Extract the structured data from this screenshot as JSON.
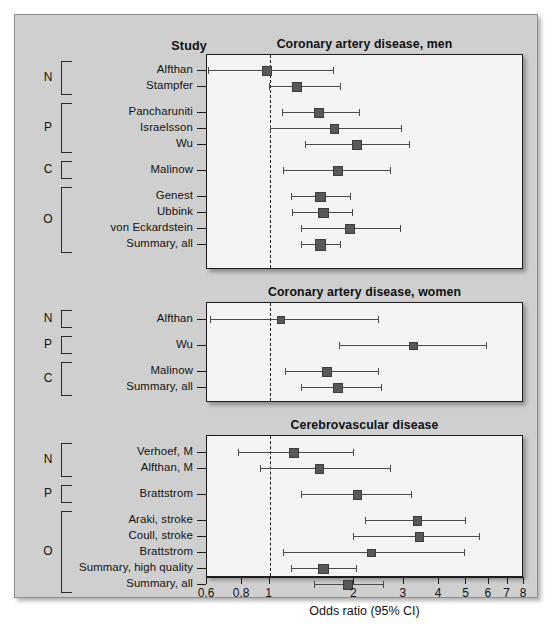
{
  "figure": {
    "axis_title": "Odds ratio (95% CI)",
    "study_column_header": "Study",
    "group_letters": [
      "N",
      "P",
      "C",
      "O"
    ],
    "tick_labels": [
      "0.6",
      "0.8",
      "1",
      "2",
      "3",
      "4",
      "5",
      "6",
      "7",
      "8"
    ],
    "colors": {
      "background": "#cfcfcf",
      "plot_background": "#f4f4f4",
      "marker": "#585858",
      "line": "#4a4a4a",
      "frame": "#1c1c1c"
    }
  },
  "chart_data": {
    "type": "scatter",
    "xlabel": "Odds ratio (95% CI)",
    "ylabel": "Study",
    "xscale": "log",
    "xlim": [
      0.6,
      8
    ],
    "xticks": [
      0.6,
      0.8,
      1,
      2,
      3,
      4,
      5,
      6,
      7,
      8
    ],
    "xticklabels": [
      "0.6",
      "0.8",
      "1",
      "2",
      "3",
      "4",
      "5",
      "6",
      "7",
      "8"
    ],
    "reference_line": 1,
    "grid": false,
    "legend": "none",
    "panels": [
      {
        "title": "Coronary artery disease, men",
        "groups": [
          {
            "letter": "N",
            "rows": [
              {
                "label": "Alfthan",
                "or": 0.98,
                "lo": 0.61,
                "hi": 1.7
              },
              {
                "label": "Stampfer",
                "or": 1.25,
                "lo": 1.0,
                "hi": 1.8
              }
            ]
          },
          {
            "letter": "P",
            "rows": [
              {
                "label": "Pancharuniti",
                "or": 1.5,
                "lo": 1.12,
                "hi": 2.1
              },
              {
                "label": "Israelsson",
                "or": 1.7,
                "lo": 1.01,
                "hi": 2.95
              },
              {
                "label": "Wu",
                "or": 2.05,
                "lo": 1.35,
                "hi": 3.15
              }
            ]
          },
          {
            "letter": "C",
            "rows": [
              {
                "label": "Malinow",
                "or": 1.75,
                "lo": 1.13,
                "hi": 2.7
              }
            ]
          },
          {
            "letter": "O",
            "rows": [
              {
                "label": "Genest",
                "or": 1.52,
                "lo": 1.2,
                "hi": 1.95
              },
              {
                "label": "Ubbink",
                "or": 1.55,
                "lo": 1.21,
                "hi": 1.98
              },
              {
                "label": "von Eckardstein",
                "or": 1.93,
                "lo": 1.3,
                "hi": 2.92
              },
              {
                "label": "Summary, all",
                "or": 1.52,
                "lo": 1.3,
                "hi": 1.8
              }
            ]
          }
        ]
      },
      {
        "title": "Coronary artery disease, women",
        "groups": [
          {
            "letter": "N",
            "rows": [
              {
                "label": "Alfthan",
                "or": 1.1,
                "lo": 0.62,
                "hi": 2.45
              }
            ]
          },
          {
            "letter": "P",
            "rows": [
              {
                "label": "Wu",
                "or": 3.25,
                "lo": 1.78,
                "hi": 5.9
              }
            ]
          },
          {
            "letter": "C",
            "rows": [
              {
                "label": "Malinow",
                "or": 1.6,
                "lo": 1.14,
                "hi": 2.45
              },
              {
                "label": "Summary, all",
                "or": 1.75,
                "lo": 1.3,
                "hi": 2.5
              }
            ]
          }
        ]
      },
      {
        "title": "Cerebrovascular disease",
        "groups": [
          {
            "letter": "N",
            "rows": [
              {
                "label": "Verhoef, M",
                "or": 1.22,
                "lo": 0.78,
                "hi": 2.0
              },
              {
                "label": "Alfthan, M",
                "or": 1.5,
                "lo": 0.93,
                "hi": 2.7
              }
            ]
          },
          {
            "letter": "P",
            "rows": [
              {
                "label": "Brattstrom",
                "or": 2.05,
                "lo": 1.3,
                "hi": 3.2
              }
            ]
          },
          {
            "letter": "O",
            "rows": [
              {
                "label": "Araki, stroke",
                "or": 3.35,
                "lo": 2.2,
                "hi": 5.0
              },
              {
                "label": "Coull, stroke",
                "or": 3.4,
                "lo": 2.0,
                "hi": 5.6
              },
              {
                "label": "Brattstrom",
                "or": 2.3,
                "lo": 1.13,
                "hi": 4.95
              },
              {
                "label": "Summary, high quality",
                "or": 1.55,
                "lo": 1.2,
                "hi": 2.05
              },
              {
                "label": "Summary, all",
                "or": 1.9,
                "lo": 1.45,
                "hi": 2.55
              }
            ]
          }
        ]
      }
    ]
  }
}
